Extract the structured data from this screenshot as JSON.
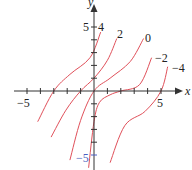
{
  "chart_data": {
    "type": "line",
    "title": "",
    "xlabel": "x",
    "ylabel": "y",
    "xlim": [
      -6,
      6.5
    ],
    "ylim": [
      -6,
      6.5
    ],
    "x_ticks": [
      -5,
      -4,
      -3,
      -2,
      -1,
      1,
      2,
      3,
      4,
      5
    ],
    "y_ticks": [
      -5,
      -4,
      -3,
      -2,
      -1,
      1,
      2,
      3,
      4,
      5
    ],
    "x_tick_labels": [
      {
        "value": -5,
        "label": "−5"
      },
      {
        "value": 5,
        "label": "5"
      }
    ],
    "y_tick_labels": [
      {
        "value": 5,
        "label": "5"
      },
      {
        "value": -5,
        "label": "−5"
      }
    ],
    "grid": false,
    "legend": "inline labels at top of each curve",
    "series": [
      {
        "name": "4",
        "label": "4",
        "points": [
          [
            -4.2,
            -2.4
          ],
          [
            -3,
            0
          ],
          [
            -1.8,
            1.3
          ],
          [
            -0.3,
            2.6
          ],
          [
            0.5,
            4.6
          ]
        ]
      },
      {
        "name": "2",
        "label": "2",
        "points": [
          [
            -3.2,
            -3.6
          ],
          [
            -2.1,
            -1.5
          ],
          [
            -1,
            0
          ],
          [
            0,
            1
          ],
          [
            1,
            2.4
          ],
          [
            1.7,
            4.1
          ]
        ]
      },
      {
        "name": "0",
        "label": "0",
        "points": [
          [
            -1.8,
            -5.4
          ],
          [
            -1,
            -2.3
          ],
          [
            0,
            0
          ],
          [
            1.2,
            1
          ],
          [
            2.7,
            2.3
          ],
          [
            3.7,
            4.1
          ]
        ]
      },
      {
        "name": "-2",
        "label": "−2",
        "points": [
          [
            -0.4,
            -6
          ],
          [
            0,
            -2.4
          ],
          [
            0.4,
            -0.9
          ],
          [
            1.2,
            -0.3
          ],
          [
            2,
            0
          ],
          [
            3.4,
            0.5
          ],
          [
            4.3,
            2.6
          ]
        ]
      },
      {
        "name": "-4",
        "label": "−4",
        "points": [
          [
            1.2,
            -5.6
          ],
          [
            2.3,
            -2.7
          ],
          [
            3.8,
            -1.6
          ],
          [
            5,
            0
          ],
          [
            5.5,
            1.9
          ]
        ]
      }
    ],
    "colors": {
      "curve": "#e0505a",
      "axis": "#333333",
      "tick_label_y_neg5": "#4a5fc1"
    }
  }
}
